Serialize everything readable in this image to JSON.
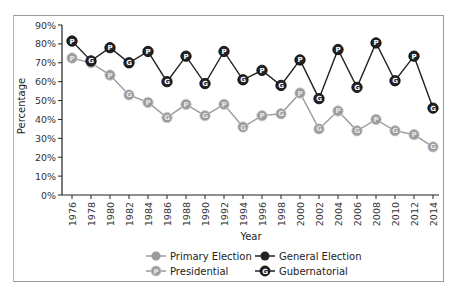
{
  "chart_data": {
    "type": "line",
    "title": "",
    "xlabel": "Year",
    "ylabel": "Percentage",
    "ylim": [
      0,
      90
    ],
    "yticks": [
      "0%",
      "10%",
      "20%",
      "30%",
      "40%",
      "50%",
      "60%",
      "70%",
      "80%",
      "90%"
    ],
    "ytick_values": [
      0,
      10,
      20,
      30,
      40,
      50,
      60,
      70,
      80,
      90
    ],
    "x": [
      "1976",
      "1978",
      "1980",
      "1982",
      "1984",
      "1986",
      "1988",
      "1990",
      "1992",
      "1994",
      "1996",
      "1998",
      "2000",
      "2002",
      "2004",
      "2006",
      "2008",
      "2010",
      "2012",
      "2014"
    ],
    "point_types": [
      "P",
      "G",
      "P",
      "G",
      "P",
      "G",
      "P",
      "G",
      "P",
      "G",
      "P",
      "G",
      "P",
      "G",
      "P",
      "G",
      "P",
      "G",
      "P",
      "G"
    ],
    "grid": false,
    "legend_position": "bottom-center",
    "series": [
      {
        "name": "Primary Election",
        "color": "#9b9b9b",
        "values": [
          72.5,
          70,
          63.5,
          53,
          49,
          41,
          48,
          42,
          48,
          36,
          42,
          43,
          54,
          35,
          44.5,
          34,
          40,
          34,
          32,
          25.5
        ]
      },
      {
        "name": "General Election",
        "color": "#222222",
        "values": [
          81.5,
          71,
          78,
          70,
          76,
          60,
          73.5,
          59,
          76,
          61,
          66,
          58,
          71.5,
          51,
          77,
          57,
          80.5,
          60.5,
          73.5,
          46
        ]
      }
    ],
    "legend": [
      {
        "label": "Primary Election",
        "kind": "series",
        "color": "#9b9b9b",
        "glyph": ""
      },
      {
        "label": "General Election",
        "kind": "series",
        "color": "#222222",
        "glyph": ""
      },
      {
        "label": "Presidential",
        "kind": "marker",
        "color": "#9b9b9b",
        "glyph": "P"
      },
      {
        "label": "Gubernatorial",
        "kind": "marker",
        "color": "#222222",
        "glyph": "G"
      }
    ]
  }
}
